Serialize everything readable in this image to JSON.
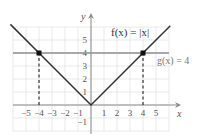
{
  "chart_data": {
    "type": "line",
    "title": "",
    "xlabel": "x",
    "ylabel": "y",
    "xlim": [
      -6,
      6
    ],
    "ylim": [
      -2,
      6
    ],
    "grid": true,
    "x_ticks": [
      -5,
      -4,
      -3,
      -2,
      -1,
      1,
      2,
      3,
      4,
      5
    ],
    "x_tick_labels": [
      "−5",
      "−4",
      "−3",
      "−2",
      "−1",
      "1",
      "2",
      "3",
      "4",
      "5"
    ],
    "y_ticks": [
      -1,
      1,
      2,
      3,
      4,
      5
    ],
    "y_tick_labels": [
      "−1",
      "1",
      "2",
      "3",
      "4",
      "5"
    ],
    "series": [
      {
        "name": "f(x) = |x|",
        "label": "f(x) = |x|",
        "x": [
          -6.2,
          -4,
          0,
          4,
          6.1
        ],
        "y": [
          6.2,
          4,
          0,
          4,
          6.1
        ],
        "color": "#333333"
      },
      {
        "name": "g(x) = 4",
        "label": "g(x) = 4",
        "x": [
          -6,
          6
        ],
        "y": [
          4,
          4
        ],
        "color": "#888888"
      }
    ],
    "intersection_points": [
      {
        "x": -4,
        "y": 4
      },
      {
        "x": 4,
        "y": 4
      }
    ],
    "annotations": [
      {
        "type": "dashed-vertical",
        "x": -4,
        "from_y": 0,
        "to_y": 4
      },
      {
        "type": "dashed-vertical",
        "x": 4,
        "from_y": 0,
        "to_y": 4
      }
    ],
    "legend": "inline labels"
  },
  "labels": {
    "f": "f(x) = |x|",
    "g": "g(x) = 4",
    "x_axis": "x",
    "y_axis": "y"
  },
  "colors": {
    "grid": "#e3e3e3",
    "axis": "#8a8a8a",
    "f_line": "#333333",
    "g_line": "#8f8f8f",
    "point": "#111111"
  }
}
